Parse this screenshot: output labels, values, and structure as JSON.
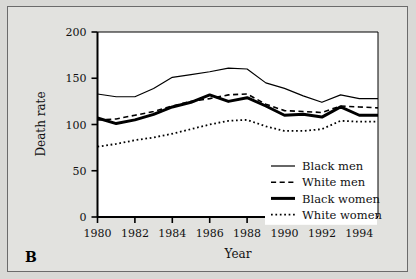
{
  "figure": {
    "panel_label": "B",
    "background_color": "#d9d9d6",
    "plot_background_color": "#ffffff",
    "frame_color": "#6b6b6b",
    "axis_color": "#000000"
  },
  "chart_data": {
    "type": "line",
    "title": "",
    "xlabel": "Year",
    "ylabel": "Death rate",
    "xlim": [
      1980,
      1995
    ],
    "ylim": [
      0,
      200
    ],
    "xticks": [
      1980,
      1982,
      1984,
      1986,
      1988,
      1990,
      1992,
      1994
    ],
    "xtick_labels": [
      "1980",
      "1982",
      "1984",
      "1986",
      "1988",
      "1990",
      "1992",
      "1994"
    ],
    "yticks": [
      0,
      50,
      100,
      150,
      200
    ],
    "ytick_labels": [
      "0",
      "50",
      "100",
      "150",
      "200"
    ],
    "grid": false,
    "legend_position": "lower right",
    "x": [
      1980,
      1981,
      1982,
      1983,
      1984,
      1985,
      1986,
      1987,
      1988,
      1989,
      1990,
      1991,
      1992,
      1993,
      1994,
      1995
    ],
    "series": [
      {
        "name": "Black men",
        "style": "solid",
        "width": 1.2,
        "color": "#000000",
        "values": [
          133,
          130,
          130,
          139,
          151,
          154,
          157,
          161,
          160,
          145,
          139,
          131,
          124,
          132,
          128,
          128
        ]
      },
      {
        "name": "White men",
        "style": "dashed",
        "width": 1.6,
        "color": "#000000",
        "values": [
          105,
          106,
          110,
          114,
          120,
          125,
          128,
          132,
          133,
          122,
          115,
          114,
          113,
          120,
          119,
          118
        ]
      },
      {
        "name": "Black women",
        "style": "solid",
        "width": 3.0,
        "color": "#000000",
        "values": [
          107,
          101,
          105,
          111,
          119,
          124,
          132,
          125,
          129,
          120,
          110,
          111,
          108,
          119,
          110,
          110
        ]
      },
      {
        "name": "White women",
        "style": "dotted",
        "width": 1.8,
        "color": "#000000",
        "values": [
          76,
          79,
          83,
          86,
          90,
          95,
          100,
          104,
          105,
          98,
          93,
          93,
          95,
          104,
          103,
          103
        ]
      }
    ]
  }
}
